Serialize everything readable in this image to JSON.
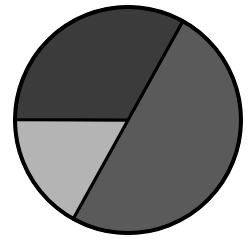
{
  "chart_data": {
    "type": "pie",
    "title": "",
    "categories": [
      "Slice A",
      "Slice B",
      "Slice C"
    ],
    "values": [
      50,
      17,
      33
    ],
    "colors": [
      "#5a5a5a",
      "#b4b4b4",
      "#3b3b3b"
    ],
    "start_angle_deg": -61,
    "direction": "clockwise",
    "legend": "none",
    "labels_shown": false,
    "center": [
      128,
      120
    ],
    "radius": 113,
    "stroke": "#000000",
    "stroke_width": 4
  }
}
